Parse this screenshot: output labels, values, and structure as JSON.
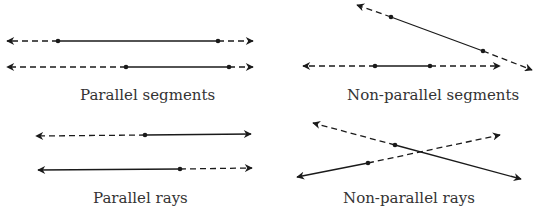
{
  "colors": {
    "stroke": "#1a1a1a",
    "text": "#333333",
    "background": "#ffffff"
  },
  "panels": [
    {
      "id": "parallel-segments",
      "label": "Parallel segments",
      "label_pos": [
        80,
        88
      ],
      "lines": [
        {
          "start": [
            6,
            41
          ],
          "p1": [
            58,
            41
          ],
          "p2": [
            218,
            41
          ],
          "end": [
            253,
            41
          ],
          "pattern": [
            "dashed-arrow",
            "solid",
            "dashed-arrow"
          ]
        },
        {
          "start": [
            6,
            67
          ],
          "p1": [
            126,
            67
          ],
          "p2": [
            229,
            67
          ],
          "end": [
            253,
            67
          ],
          "pattern": [
            "dashed-arrow",
            "solid",
            "dashed-arrow"
          ]
        }
      ]
    },
    {
      "id": "non-parallel-segments",
      "label": "Non-parallel segments",
      "label_pos": [
        347,
        88
      ],
      "lines": [
        {
          "start": [
            357,
            5
          ],
          "p1": [
            391,
            17
          ],
          "p2": [
            483,
            51
          ],
          "end": [
            532,
            70
          ],
          "pattern": [
            "dashed-arrow",
            "solid",
            "dashed-arrow"
          ]
        },
        {
          "start": [
            303,
            66
          ],
          "p1": [
            375,
            66
          ],
          "p2": [
            430,
            66
          ],
          "end": [
            500,
            66
          ],
          "pattern": [
            "dashed-arrow",
            "solid",
            "dashed-arrow"
          ]
        }
      ]
    },
    {
      "id": "parallel-rays",
      "label": "Parallel rays",
      "label_pos": [
        93,
        191
      ],
      "lines": [
        {
          "start": [
            36,
            136
          ],
          "point": [
            145,
            135
          ],
          "end": [
            251,
            134
          ],
          "pattern": [
            "dashed-arrow",
            "solid-arrow"
          ]
        },
        {
          "start": [
            38,
            170
          ],
          "point": [
            180,
            169
          ],
          "end": [
            252,
            168
          ],
          "pattern": [
            "solid-arrow",
            "dashed-arrow"
          ]
        }
      ]
    },
    {
      "id": "non-parallel-rays",
      "label": "Non-parallel rays",
      "label_pos": [
        343,
        191
      ],
      "lines": [
        {
          "start": [
            313,
            123
          ],
          "point": [
            395,
            145
          ],
          "end": [
            521,
            179
          ],
          "pattern": [
            "dashed-arrow",
            "solid-arrow"
          ]
        },
        {
          "start": [
            297,
            177
          ],
          "point": [
            368,
            163
          ],
          "end": [
            500,
            135
          ],
          "pattern": [
            "solid-arrow",
            "dashed-arrow"
          ]
        }
      ]
    }
  ]
}
